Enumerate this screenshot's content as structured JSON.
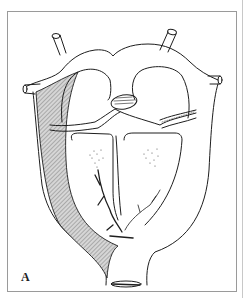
{
  "figure": {
    "panel_label": "A",
    "colors": {
      "line": "#1e1e1e",
      "hatch": "#9a9a9a",
      "frame": "#9a9a9a",
      "background": "#ffffff"
    }
  }
}
